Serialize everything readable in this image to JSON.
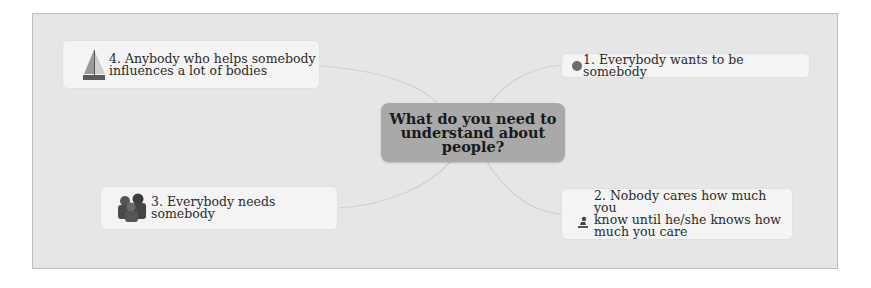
{
  "central_topic": {
    "label": "What do you need to\nunderstand about\npeople?"
  },
  "topics": [
    {
      "id": "1",
      "label": "1. Everybody wants to be somebody",
      "icon": "gray-dot-icon"
    },
    {
      "id": "2",
      "label": "2. Nobody cares how much you\nknow until he/she knows how\nmuch you care",
      "icon": "person-kneeling-icon"
    },
    {
      "id": "3",
      "label": "3. Everybody needs somebody",
      "icon": "people-group-icon"
    },
    {
      "id": "4",
      "label": "4. Anybody who helps somebody\ninfluences a lot of bodies",
      "icon": "sailboat-icon"
    }
  ],
  "colors": {
    "canvas": "#e6e6e6",
    "central_fill": "#a9a9a9",
    "topic_fill": "#f4f4f4",
    "connector": "#cfcfcf"
  }
}
